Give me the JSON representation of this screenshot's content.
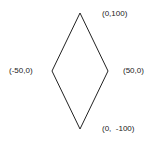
{
  "diagram": {
    "shape": "rhombus",
    "stroke_color": "#222222",
    "vertices": [
      {
        "name": "top",
        "label": "(0,100)"
      },
      {
        "name": "right",
        "label": "(50,0)"
      },
      {
        "name": "bottom",
        "label": "(0,  -100)"
      },
      {
        "name": "left",
        "label": "(-50,0)"
      }
    ]
  }
}
